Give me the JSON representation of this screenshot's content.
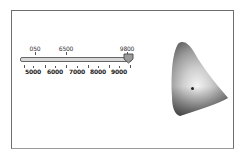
{
  "slider": {
    "name": "color-temperature-slider",
    "min": 4500,
    "max": 9800,
    "value": 9800,
    "top_labels": [
      {
        "text": "050",
        "x": 35
      },
      {
        "text": "6500",
        "x": 66
      },
      {
        "text": "9800",
        "x": 127
      }
    ],
    "bottom_labels": [
      {
        "text": "5000",
        "x": 33
      },
      {
        "text": "6000",
        "x": 55
      },
      {
        "text": "7000",
        "x": 77
      },
      {
        "text": "8000",
        "x": 98
      },
      {
        "text": "9000",
        "x": 119
      }
    ],
    "minor_ticks_x": [
      24,
      45,
      66,
      88,
      109,
      130
    ],
    "top_ticks_x": [
      35,
      66,
      127
    ],
    "colors": {
      "track": "#d8d8d8",
      "thumb": "#9a9a9a",
      "border": "#666666"
    }
  },
  "gamut_diagram": {
    "name": "chromaticity-diagram",
    "white_point": {
      "x": 192,
      "y": 88
    }
  }
}
